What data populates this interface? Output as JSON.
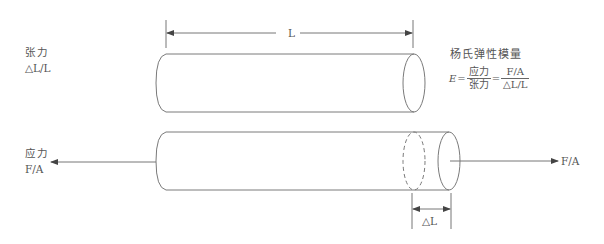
{
  "diagram": {
    "title": "杨氏弹性模量",
    "strain_label": {
      "name": "张力",
      "expression": "△L/L"
    },
    "stress_label": {
      "name": "应力",
      "expression": "F/A"
    },
    "length_label": "L",
    "delta_length_label": "△L",
    "force_right_label": "F/A",
    "formula": {
      "lhs": "E",
      "equals": "=",
      "frac1_num": "应力",
      "frac1_den": "张力",
      "equals2": "=",
      "frac2_num": "F/A",
      "frac2_den": "△L/L"
    },
    "colors": {
      "stroke": "#7a7a7a",
      "text": "#555555",
      "background": "#ffffff"
    }
  }
}
